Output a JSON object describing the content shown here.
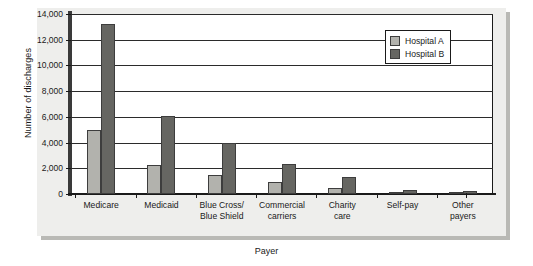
{
  "chart_data": {
    "type": "bar",
    "title": "",
    "xlabel": "Payer",
    "ylabel": "Number of discharges",
    "categories": [
      "Medicare",
      "Medicaid",
      "Blue Cross/\nBlue Shield",
      "Commercial\ncarriers",
      "Charity\ncare",
      "Self-pay",
      "Other\npayers"
    ],
    "series": [
      {
        "name": "Hospital A",
        "color": "#b2b2ad",
        "values": [
          5000,
          2250,
          1500,
          900,
          450,
          100,
          80
        ]
      },
      {
        "name": "Hospital B",
        "color": "#666662",
        "values": [
          13200,
          6050,
          3950,
          2350,
          1300,
          300,
          200
        ]
      }
    ],
    "ylim": [
      0,
      14000
    ],
    "yticks": [
      0,
      2000,
      4000,
      6000,
      8000,
      10000,
      12000,
      14000
    ],
    "ytick_labels": [
      "0",
      "2,000",
      "4,000",
      "6,000",
      "8,000",
      "10,000",
      "12,000",
      "14,000"
    ],
    "grid": true,
    "legend_position": "top-right"
  },
  "legend": {
    "entries": [
      {
        "label": "Hospital A"
      },
      {
        "label": "Hospital B"
      }
    ]
  },
  "axes": {
    "y_title": "Number of discharges",
    "x_title": "Payer"
  }
}
